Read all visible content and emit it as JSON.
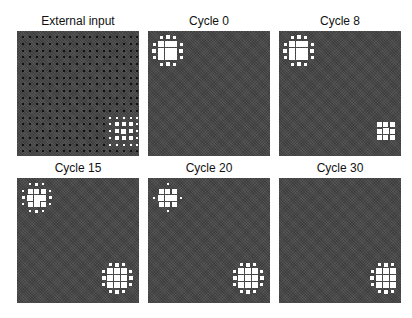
{
  "figure": {
    "grid_size": 18,
    "background_color": "#4a4a4a",
    "active_color": "#ffffff",
    "panels": [
      {
        "id": "external-input",
        "title": "External input",
        "left": 17,
        "top": 14,
        "show_dots": true,
        "clusters": [
          {
            "region": "bottom-right",
            "origin": [
              13,
              12
            ],
            "size": 5,
            "style": "input-grid"
          }
        ]
      },
      {
        "id": "cycle-0",
        "title": "Cycle 0",
        "left": 148,
        "top": 14,
        "show_dots": false,
        "clusters": [
          {
            "region": "top-left",
            "origin": [
              0,
              0
            ],
            "style": "blob-large"
          }
        ]
      },
      {
        "id": "cycle-8",
        "title": "Cycle 8",
        "left": 279,
        "top": 14,
        "show_dots": false,
        "clusters": [
          {
            "region": "top-left",
            "origin": [
              0,
              0
            ],
            "style": "blob-large"
          },
          {
            "region": "bottom-right",
            "origin": [
              14,
              13
            ],
            "style": "core-3x3"
          }
        ]
      },
      {
        "id": "cycle-15",
        "title": "Cycle 15",
        "left": 17,
        "top": 161,
        "show_dots": false,
        "clusters": [
          {
            "region": "top-left",
            "origin": [
              0,
              0
            ],
            "style": "blob-faded"
          },
          {
            "region": "bottom-right",
            "origin": [
              12,
              12
            ],
            "style": "blob-large"
          }
        ]
      },
      {
        "id": "cycle-20",
        "title": "Cycle 20",
        "left": 148,
        "top": 161,
        "show_dots": false,
        "clusters": [
          {
            "region": "top-left",
            "origin": [
              0,
              0
            ],
            "style": "blob-sparse"
          },
          {
            "region": "bottom-right",
            "origin": [
              12,
              12
            ],
            "style": "blob-large"
          }
        ]
      },
      {
        "id": "cycle-30",
        "title": "Cycle 30",
        "left": 279,
        "top": 161,
        "show_dots": false,
        "clusters": [
          {
            "region": "bottom-right",
            "origin": [
              12,
              12
            ],
            "style": "blob-clipped"
          }
        ]
      }
    ]
  }
}
